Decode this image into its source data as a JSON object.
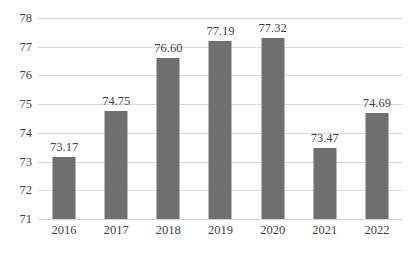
{
  "chart_data": {
    "type": "bar",
    "title": "",
    "subtitle": "",
    "xlabel": "",
    "ylabel": "",
    "categories": [
      "2016",
      "2017",
      "2018",
      "2019",
      "2020",
      "2021",
      "2022"
    ],
    "values": [
      73.17,
      74.75,
      76.6,
      77.19,
      77.32,
      73.47,
      74.69
    ],
    "value_labels": [
      "73.17",
      "74.75",
      "76.60",
      "77.19",
      "77.32",
      "73.47",
      "74.69"
    ],
    "series": [
      {
        "name": "",
        "values": [
          73.17,
          74.75,
          76.6,
          77.19,
          77.32,
          73.47,
          74.69
        ]
      }
    ],
    "ylim": [
      71,
      78
    ],
    "ytick_labels": [
      "78",
      "77",
      "76",
      "75",
      "74",
      "73",
      "72",
      "71"
    ],
    "ytick_values": [
      78,
      77,
      76,
      75,
      74,
      73,
      72,
      71
    ],
    "ytick_step": 1,
    "grid": true,
    "grid_axis": "y",
    "legend": false,
    "legend_position": "none",
    "bar_color": "#6f6f6f",
    "grid_color": "#dcdcdc",
    "text_color": "#3f3f3f",
    "background_color": "#ffffff",
    "data_labels_shown": true
  }
}
